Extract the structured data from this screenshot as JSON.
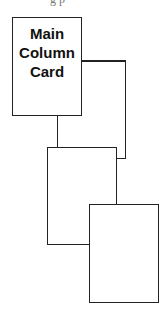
{
  "diagram": {
    "cards": [
      {
        "id": "main",
        "lines": [
          "Main",
          "Column",
          "Card"
        ]
      },
      {
        "id": "card-2",
        "lines": []
      },
      {
        "id": "card-3",
        "lines": []
      }
    ],
    "top_clipped_text": "g p"
  }
}
